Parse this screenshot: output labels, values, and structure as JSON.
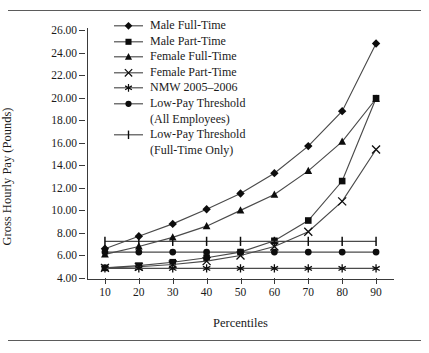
{
  "figure": {
    "top_caption": "",
    "xlabel": "Percentiles",
    "ylabel": "Gross Hourly Pay (Pounds)"
  },
  "legend": {
    "items": [
      {
        "label": "Male Full-Time",
        "sub": "",
        "marker": "diamond"
      },
      {
        "label": "Male Part-Time",
        "sub": "",
        "marker": "square"
      },
      {
        "label": "Female Full-Time",
        "sub": "",
        "marker": "triangle"
      },
      {
        "label": "Female Part-Time",
        "sub": "",
        "marker": "cross"
      },
      {
        "label": "NMW 2005–2006",
        "sub": "",
        "marker": "asterisk"
      },
      {
        "label": "Low-Pay Threshold",
        "sub": "(All Employees)",
        "marker": "circle"
      },
      {
        "label": "Low-Pay Threshold",
        "sub": "(Full-Time Only)",
        "marker": "bar"
      }
    ]
  },
  "axis": {
    "y_ticks": [
      "26.00",
      "24.00",
      "22.00",
      "20.00",
      "18.00",
      "16.00",
      "14.00",
      "12.00",
      "10.00",
      "8.00",
      "6.00",
      "4.00"
    ],
    "x_ticks": [
      "10",
      "20",
      "30",
      "40",
      "50",
      "60",
      "70",
      "80",
      "90"
    ]
  },
  "chart_data": {
    "type": "line",
    "title": "",
    "xlabel": "Percentiles",
    "ylabel": "Gross Hourly Pay (Pounds)",
    "x": [
      10,
      20,
      30,
      40,
      50,
      60,
      70,
      80,
      90
    ],
    "xlim": [
      5,
      95
    ],
    "ylim": [
      4.0,
      26.0
    ],
    "ytick_step": 2.0,
    "grid": false,
    "legend_position": "upper-left-inside",
    "series": [
      {
        "name": "Male Full-Time",
        "marker": "diamond",
        "values": [
          6.6,
          7.7,
          8.8,
          10.1,
          11.5,
          13.3,
          15.7,
          18.8,
          24.8
        ]
      },
      {
        "name": "Male Part-Time",
        "marker": "square",
        "values": [
          4.9,
          5.1,
          5.4,
          5.8,
          6.3,
          7.3,
          9.1,
          12.6,
          19.95
        ]
      },
      {
        "name": "Female Full-Time",
        "marker": "triangle",
        "values": [
          6.1,
          6.8,
          7.6,
          8.6,
          10.0,
          11.4,
          13.5,
          16.1,
          19.9
        ]
      },
      {
        "name": "Female Part-Time",
        "marker": "cross",
        "values": [
          4.9,
          5.0,
          5.2,
          5.5,
          6.0,
          6.8,
          8.1,
          10.8,
          15.4
        ]
      },
      {
        "name": "NMW 2005–2006",
        "marker": "asterisk",
        "values": [
          4.85,
          4.85,
          4.85,
          4.85,
          4.85,
          4.85,
          4.85,
          4.85,
          4.85
        ]
      },
      {
        "name": "Low-Pay Threshold (All Employees)",
        "marker": "circle",
        "values": [
          6.3,
          6.3,
          6.3,
          6.3,
          6.3,
          6.3,
          6.3,
          6.3,
          6.3
        ]
      },
      {
        "name": "Low-Pay Threshold (Full-Time Only)",
        "marker": "bar",
        "values": [
          7.25,
          7.25,
          7.25,
          7.25,
          7.25,
          7.25,
          7.25,
          7.25,
          7.25
        ]
      }
    ]
  },
  "colors": {
    "line": "#4a4a4a",
    "marker": "#0d0d0d",
    "axis": "#3a3a3a",
    "rule": "#5b5b5b",
    "text": "#1a1a1a"
  }
}
